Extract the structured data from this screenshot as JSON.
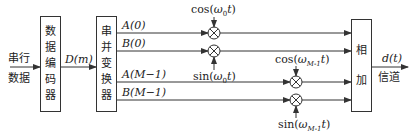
{
  "input": {
    "line1": "串行",
    "line2": "数据"
  },
  "encoder": {
    "chars": [
      "数",
      "据",
      "编",
      "码",
      "器"
    ]
  },
  "encoder_output": "D(m)",
  "converter": {
    "chars": [
      "串",
      "并",
      "变",
      "换",
      "器"
    ]
  },
  "branches": [
    {
      "label": "A(0)",
      "carrier": "cos(ω₀t)"
    },
    {
      "label": "B(0)",
      "carrier": "sin(ω₀t)"
    },
    {
      "label": "A(M−1)",
      "carrier": "cos(ωM-1t)"
    },
    {
      "label": "B(M−1)",
      "carrier": "sin(ωM-1t)"
    }
  ],
  "carriers": {
    "cos0": {
      "fn": "cos(",
      "sym": "ω",
      "sub": "0",
      "var": "t",
      "close": ")"
    },
    "sin0": {
      "fn": "sin(",
      "sym": "ω",
      "sub": "0",
      "var": "t",
      "close": ")"
    },
    "cosM": {
      "fn": "cos(",
      "sym": "ω",
      "sub": "M-1",
      "var": "t",
      "close": ")"
    },
    "sinM": {
      "fn": "sin(",
      "sym": "ω",
      "sub": "M-1",
      "var": "t",
      "close": ")"
    }
  },
  "adder": {
    "chars": [
      "相",
      "加"
    ]
  },
  "output": {
    "signal": "d(t)",
    "channel": "信道"
  },
  "colors": {
    "stroke": "#333333",
    "background": "#ffffff"
  }
}
